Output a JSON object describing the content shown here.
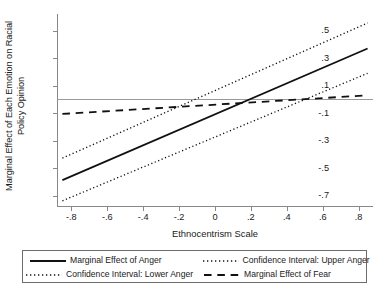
{
  "chart_data": {
    "type": "line",
    "title": "",
    "xlabel": "Ethnocentrism Scale",
    "ylabel": "Marginal Effect of Each Emotion on Racial Policy Opinion",
    "ylabel_lines": [
      "Marginal Effect of Each Emotion on Racial",
      "Policy Opinion"
    ],
    "xlim": [
      -0.88,
      0.88
    ],
    "ylim": [
      -0.78,
      0.62
    ],
    "xticks": [
      -0.8,
      -0.6,
      -0.4,
      -0.2,
      0,
      0.2,
      0.4,
      0.6,
      0.8
    ],
    "xtick_labels": [
      "-.8",
      "-.6",
      "-.4",
      "-.2",
      "0",
      ".2",
      ".4",
      ".6",
      ".8"
    ],
    "yticks": [
      0.5,
      0.3,
      0.1,
      -0.1,
      -0.3,
      -0.5,
      -0.7
    ],
    "ytick_labels": [
      ".5",
      ".3",
      ".1",
      "-.1",
      "-.3",
      "-.5",
      "-.7"
    ],
    "grid": false,
    "legend_position": "below-plot",
    "reference_line": {
      "y": 0,
      "style": "solid",
      "color": "#9a9a9a"
    },
    "x": [
      -0.85,
      0.85
    ],
    "series": [
      {
        "name": "Marginal Effect of Anger",
        "style": "solid",
        "color": "#111111",
        "width": 1.8,
        "values": [
          -0.585,
          0.37
        ]
      },
      {
        "name": "Confidence Interval: Upper Anger",
        "style": "dotted",
        "color": "#111111",
        "width": 1.3,
        "values": [
          -0.425,
          0.555
        ]
      },
      {
        "name": "Confidence Interval: Lower Anger",
        "style": "dotted",
        "color": "#111111",
        "width": 1.3,
        "values": [
          -0.735,
          0.19
        ]
      },
      {
        "name": "Marginal Effect of Fear",
        "style": "dashed",
        "color": "#111111",
        "width": 1.8,
        "values": [
          -0.105,
          0.03
        ]
      }
    ]
  },
  "legend": {
    "entries": [
      {
        "label": "Marginal Effect of Anger",
        "style": "solid"
      },
      {
        "label": "Confidence Interval: Upper Anger",
        "style": "dotted"
      },
      {
        "label": "Confidence Interval: Lower Anger",
        "style": "dotted"
      },
      {
        "label": "Marginal Effect of Fear",
        "style": "dashed"
      }
    ]
  }
}
